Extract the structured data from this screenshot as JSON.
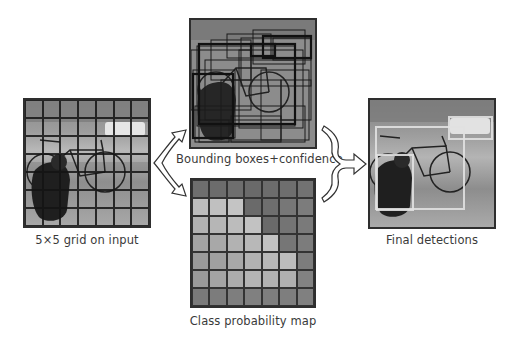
{
  "diagram": {
    "panels": {
      "input": {
        "caption": "5×5 grid on input",
        "grid_rows": 7,
        "grid_cols": 7
      },
      "bounding_boxes": {
        "caption": "Bounding boxes+confidence"
      },
      "class_map": {
        "caption": "Class probability map",
        "grid_rows": 7,
        "grid_cols": 7,
        "cell_shades": [
          [
            "#6e6e6e",
            "#6c6c6c",
            "#6e6e6e",
            "#6a6a6a",
            "#6c6c6c",
            "#6e6e6e",
            "#727272"
          ],
          [
            "#bdbdbd",
            "#c0c0c0",
            "#c4c4c4",
            "#6a6a6a",
            "#6e6e6e",
            "#777777",
            "#7c7c7c"
          ],
          [
            "#b2b2b2",
            "#b6b6b6",
            "#bcbcbc",
            "#c2c2c2",
            "#6a6a6a",
            "#747474",
            "#7a7a7a"
          ],
          [
            "#a4a4a4",
            "#a8a8a8",
            "#b2b2b2",
            "#b8b8b8",
            "#c2c2c2",
            "#767676",
            "#7c7c7c"
          ],
          [
            "#9a9a9a",
            "#a0a0a0",
            "#a8a8a8",
            "#b2b2b2",
            "#b8b8b8",
            "#bcbcbc",
            "#7c7c7c"
          ],
          [
            "#9a9a9a",
            "#a4a4a4",
            "#acacac",
            "#b4b4b4",
            "#b2b2b2",
            "#b0b0b0",
            "#828282"
          ],
          [
            "#7a7a7a",
            "#7c7c7c",
            "#7e7e7e",
            "#808080",
            "#7e7e7e",
            "#7e7e7e",
            "#808080"
          ]
        ]
      },
      "final": {
        "caption": "Final detections",
        "detections": [
          {
            "label": "dog",
            "left": 6,
            "top": 54,
            "width": 38,
            "height": 57
          },
          {
            "label": "bicycle",
            "left": 5,
            "top": 26,
            "width": 90,
            "height": 84
          },
          {
            "label": "car",
            "left": 78,
            "top": 16,
            "width": 45,
            "height": 24
          }
        ]
      }
    },
    "arrows": [
      {
        "from": "input",
        "to": [
          "bounding_boxes",
          "class_map"
        ],
        "style": "split-outline"
      },
      {
        "from": [
          "bounding_boxes",
          "class_map"
        ],
        "to": "final",
        "style": "merge-outline"
      }
    ]
  }
}
